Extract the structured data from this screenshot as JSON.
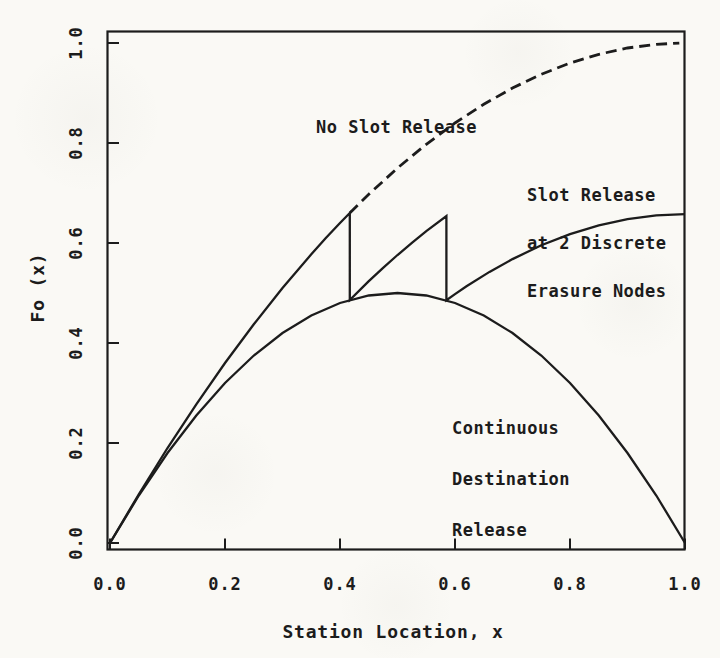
{
  "figure": {
    "background_color": "#faf9f5",
    "ink_color": "#1c1c1c",
    "style": "scanned monochrome line plot, monospace typewriter labels"
  },
  "chart_data": {
    "type": "line",
    "title": "",
    "xlabel": "Station Location, x",
    "ylabel": "Fo (x)",
    "xlim": [
      0,
      1.005
    ],
    "ylim": [
      -0.015,
      1.04
    ],
    "grid": false,
    "legend": "inline annotations near curves",
    "x_tick_values": [
      0,
      0.2,
      0.4,
      0.6,
      0.8,
      1.0
    ],
    "x_tick_labels": [
      "0.0",
      "0.2",
      "0.4",
      "0.6",
      "0.8",
      "1.0"
    ],
    "y_tick_values": [
      0,
      0.2,
      0.4,
      0.6,
      0.8,
      1.0
    ],
    "y_tick_labels": [
      "0.0",
      "0.2",
      "0.4",
      "0.6",
      "0.8",
      "1.0"
    ],
    "series": [
      {
        "name": "No Slot Release",
        "line_style": "dashed",
        "color": "#1c1c1c",
        "formula": "F(x) = x(2-x), dashed portion x > 0.417",
        "points": [
          [
            0.417,
            0.66
          ],
          [
            0.45,
            0.6975
          ],
          [
            0.5,
            0.75
          ],
          [
            0.55,
            0.7975
          ],
          [
            0.6,
            0.84
          ],
          [
            0.65,
            0.8775
          ],
          [
            0.7,
            0.91
          ],
          [
            0.75,
            0.9375
          ],
          [
            0.8,
            0.96
          ],
          [
            0.85,
            0.9775
          ],
          [
            0.9,
            0.99
          ],
          [
            0.95,
            0.9975
          ],
          [
            0.99,
            0.9999
          ]
        ]
      },
      {
        "name": "Slot Release at 2 Discrete Erasure Nodes",
        "line_style": "solid",
        "color": "#1c1c1c",
        "erasure_node_x": [
          0.417,
          0.585
        ],
        "points": [
          [
            0,
            0
          ],
          [
            0.05,
            0.0975
          ],
          [
            0.1,
            0.19
          ],
          [
            0.15,
            0.2775
          ],
          [
            0.2,
            0.36
          ],
          [
            0.25,
            0.4375
          ],
          [
            0.3,
            0.51
          ],
          [
            0.35,
            0.5775
          ],
          [
            0.375,
            0.6094
          ],
          [
            0.4,
            0.64
          ],
          [
            0.417,
            0.66
          ],
          [
            0.417,
            0.486
          ],
          [
            0.45,
            0.5236
          ],
          [
            0.475,
            0.5505
          ],
          [
            0.5,
            0.5761
          ],
          [
            0.525,
            0.6005
          ],
          [
            0.55,
            0.6236
          ],
          [
            0.585,
            0.6539
          ],
          [
            0.585,
            0.4856
          ],
          [
            0.6,
            0.4978
          ],
          [
            0.62,
            0.5134
          ],
          [
            0.66,
            0.5422
          ],
          [
            0.7,
            0.5678
          ],
          [
            0.75,
            0.5953
          ],
          [
            0.8,
            0.6178
          ],
          [
            0.85,
            0.6353
          ],
          [
            0.9,
            0.6478
          ],
          [
            0.95,
            0.6553
          ],
          [
            1,
            0.6578
          ]
        ]
      },
      {
        "name": "Continuous Destination Release",
        "line_style": "solid",
        "color": "#1c1c1c",
        "formula": "F(x) = 2x(1-x)",
        "points": [
          [
            0,
            0
          ],
          [
            0.05,
            0.095
          ],
          [
            0.1,
            0.18
          ],
          [
            0.15,
            0.255
          ],
          [
            0.2,
            0.32
          ],
          [
            0.25,
            0.375
          ],
          [
            0.3,
            0.42
          ],
          [
            0.35,
            0.455
          ],
          [
            0.4,
            0.48
          ],
          [
            0.45,
            0.495
          ],
          [
            0.5,
            0.5
          ],
          [
            0.55,
            0.495
          ],
          [
            0.6,
            0.48
          ],
          [
            0.65,
            0.455
          ],
          [
            0.7,
            0.42
          ],
          [
            0.75,
            0.375
          ],
          [
            0.8,
            0.32
          ],
          [
            0.85,
            0.255
          ],
          [
            0.9,
            0.18
          ],
          [
            0.95,
            0.095
          ],
          [
            1,
            0
          ]
        ]
      }
    ],
    "annotations": [
      {
        "name": "no-slot-release-label",
        "lines": [
          "No Slot Release"
        ]
      },
      {
        "name": "slot-release-label",
        "lines": [
          "Slot Release",
          "at 2 Discrete",
          "Erasure Nodes"
        ]
      },
      {
        "name": "continuous-release-label",
        "lines": [
          "Continuous",
          "Destination",
          "Release"
        ]
      }
    ]
  }
}
